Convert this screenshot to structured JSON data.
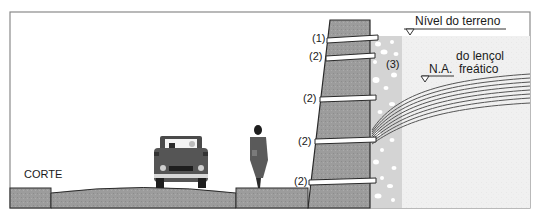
{
  "diagram": {
    "title": "CORTE",
    "labels": {
      "nivel_terreno": "Nível do terreno",
      "na_line1": "do lençol",
      "na_prefix": "N.A.",
      "na_line2": "freático",
      "drain": "(3)",
      "tie_top": "(1)",
      "tie": "(2)"
    },
    "tie_labels": [
      "(1)",
      "(2)",
      "(2)",
      "(2)",
      "(2)"
    ],
    "colors": {
      "frame": "#8a8a8a",
      "wall_fill": "#9a9a9a",
      "ground_fill": "#9c9c9c",
      "gravel_fill": "#d6d6d6",
      "soil_fill": "#efefef",
      "outline": "#2a2a2a",
      "water_lines": "#555555",
      "tie_fill": "#ffffff"
    },
    "elements": [
      "retaining-wall",
      "tie-rods",
      "gravel-drain",
      "water-table-lines",
      "road",
      "sidewalk",
      "car",
      "pedestrian"
    ]
  }
}
